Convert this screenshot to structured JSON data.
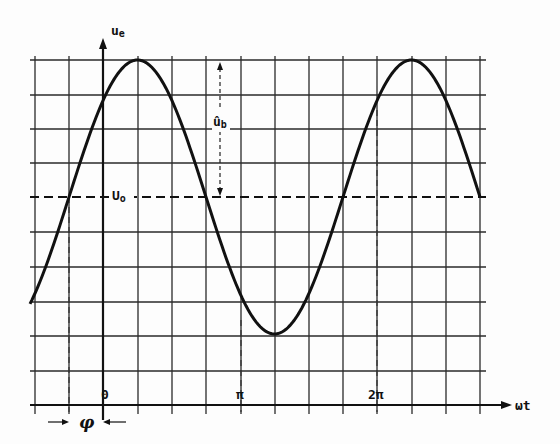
{
  "diagram": {
    "y_axis_label": "u",
    "y_axis_sub": "e",
    "x_axis_label": "ωt",
    "offset_label": "U",
    "offset_sub": "o",
    "amplitude_label": "û",
    "amplitude_sub": "b",
    "phase_label": "φ",
    "ticks": {
      "origin": "0",
      "pi": "π",
      "two_pi": "2π"
    },
    "colors": {
      "line": "#111111",
      "grid": "#2a2a2a",
      "background": "#fdfdfd"
    }
  },
  "chart_data": {
    "type": "line",
    "title": "",
    "xlabel": "ωt",
    "ylabel": "u_e",
    "function": "u_e = U_o + û_b · sin(ωt + φ)",
    "offset": "U_o",
    "amplitude": "û_b",
    "phase_shift": "φ ≈ π/4",
    "x_ticks": [
      "0",
      "π",
      "2π"
    ],
    "grid": true,
    "grid_columns": 13,
    "grid_rows": 10
  }
}
